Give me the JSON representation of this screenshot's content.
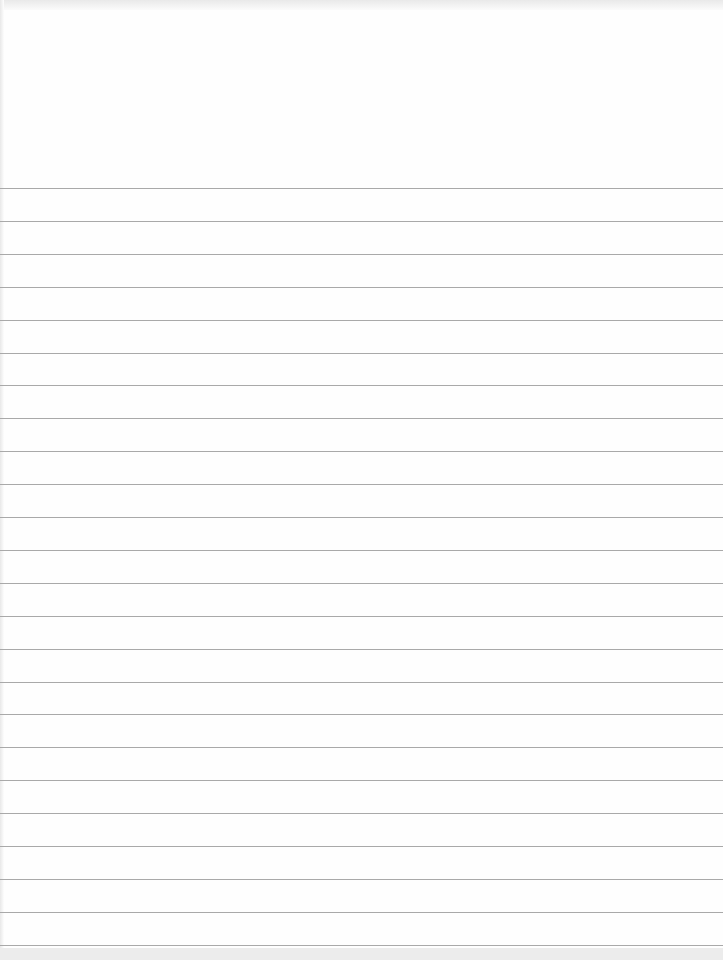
{
  "document": {
    "type": "blank lined paper",
    "content": "",
    "rule_color": "#a9a9a9",
    "paper_color": "#fefefe",
    "rules": {
      "count": 24,
      "first_y": 188,
      "spacing": 32.9
    }
  }
}
